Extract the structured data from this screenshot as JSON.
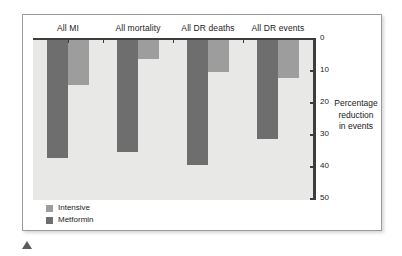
{
  "chart_data": {
    "type": "bar",
    "title": "",
    "subtitle": "",
    "xlabel": "",
    "ylabel": "Percentage reduction in events",
    "ylabel_lines": [
      "Percentage",
      "reduction",
      "in events"
    ],
    "categories": [
      "All MI",
      "All mortality",
      "All DR deaths",
      "All DR events"
    ],
    "series": [
      {
        "name": "Metformin",
        "color": "#6e6e6e",
        "values": [
          37,
          35,
          39,
          31
        ]
      },
      {
        "name": "Intensive",
        "color": "#9d9d9d",
        "values": [
          14,
          6,
          10,
          12
        ]
      }
    ],
    "series_draw_order": [
      "Metformin",
      "Intensive"
    ],
    "ylim": [
      0,
      50
    ],
    "y_inverted": true,
    "y_ticks": [
      0,
      10,
      20,
      30,
      40,
      50
    ],
    "y_tick_labels": [
      "0",
      "10",
      "20",
      "30",
      "40",
      "50"
    ],
    "grid": false,
    "legend": {
      "position": "bottom-left",
      "entries": [
        {
          "label": "Intensive",
          "color": "#9d9d9d"
        },
        {
          "label": "Metformin",
          "color": "#6e6e6e"
        }
      ]
    },
    "plot_background": "#e8e8e6",
    "axis_color": "#3d3d3d"
  },
  "figure": {
    "card_background": "#ffffff",
    "border_color": "#9a9a9a"
  }
}
